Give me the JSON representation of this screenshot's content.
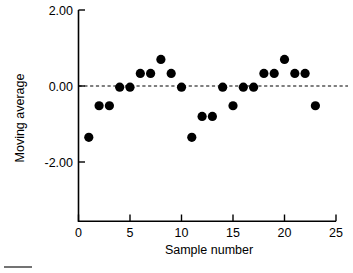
{
  "chart_data": {
    "type": "scatter",
    "title": "",
    "xlabel": "Sample number",
    "ylabel": "Moving average",
    "xlim": [
      0,
      25
    ],
    "ylim": [
      -2.6,
      2.0
    ],
    "grid": false,
    "legend": "none",
    "x_ticks": [
      "0",
      "5",
      "10",
      "15",
      "20",
      "25"
    ],
    "x_tick_values": [
      0,
      5,
      10,
      15,
      20,
      25
    ],
    "y_ticks": [
      "2.00",
      "0.00",
      "-2.00"
    ],
    "y_tick_values": [
      2.0,
      0.0,
      -2.0
    ],
    "reference_line": {
      "value": 0.0,
      "style": "dashed",
      "label": "0.00"
    },
    "marker": {
      "shape": "circle",
      "color": "#000000",
      "size": 4.6
    },
    "x": [
      1,
      2,
      3,
      4,
      5,
      6,
      7,
      8,
      9,
      10,
      11,
      12,
      13,
      14,
      15,
      16,
      17,
      18,
      19,
      20,
      21,
      22,
      23
    ],
    "values": [
      -1.35,
      -0.52,
      -0.52,
      -0.03,
      -0.03,
      0.33,
      0.33,
      0.7,
      0.33,
      -0.03,
      -1.35,
      -0.8,
      -0.8,
      -0.03,
      -0.52,
      -0.03,
      -0.03,
      0.33,
      0.33,
      0.7,
      0.33,
      0.33,
      -0.52
    ],
    "series": [
      {
        "name": "Moving average",
        "values": [
          -1.35,
          -0.52,
          -0.52,
          -0.03,
          -0.03,
          0.33,
          0.33,
          0.7,
          0.33,
          -0.03,
          -1.35,
          -0.8,
          -0.8,
          -0.03,
          -0.52,
          -0.03,
          -0.03,
          0.33,
          0.33,
          0.7,
          0.33,
          0.33,
          -0.52
        ]
      }
    ]
  },
  "colors": {
    "axis": "#000000",
    "marker": "#000000",
    "background": "#ffffff"
  }
}
